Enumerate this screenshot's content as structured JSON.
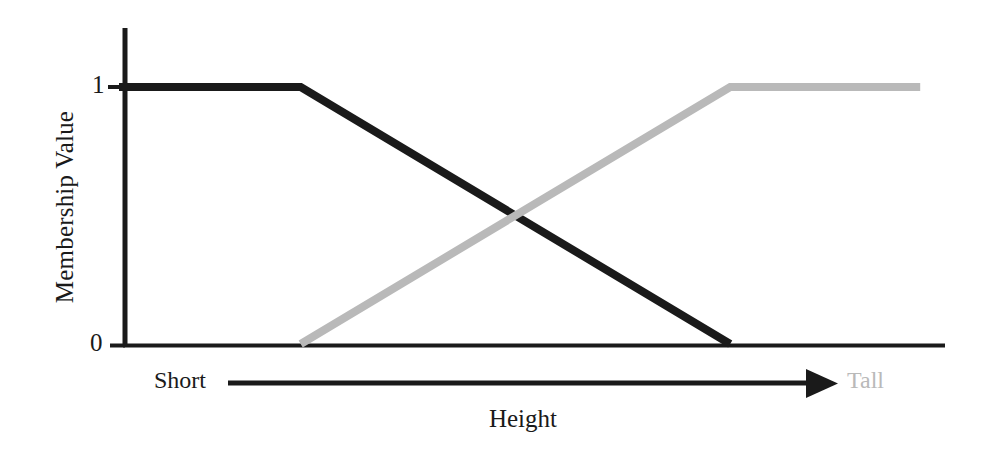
{
  "chart_data": {
    "type": "line",
    "title": "",
    "xlabel": "Height",
    "ylabel": "Membership Value",
    "xlim": [
      0,
      1
    ],
    "ylim": [
      0,
      1
    ],
    "grid": false,
    "legend_position": "none",
    "y_ticks": [
      "0",
      "1"
    ],
    "y_tick_values": [
      0,
      1
    ],
    "x_ticks": [],
    "series": [
      {
        "name": "Short",
        "color": "#1a1a1a",
        "shape": "trapezoid-descending",
        "points": [
          {
            "x": 0.0,
            "y": 1.0
          },
          {
            "x": 0.22,
            "y": 1.0
          },
          {
            "x": 0.74,
            "y": 0.0
          }
        ]
      },
      {
        "name": "Tall",
        "color": "#b9b9b9",
        "shape": "trapezoid-ascending",
        "points": [
          {
            "x": 0.22,
            "y": 0.0
          },
          {
            "x": 0.74,
            "y": 1.0
          },
          {
            "x": 0.97,
            "y": 1.0
          }
        ]
      }
    ],
    "annotations": [
      {
        "name": "axis-direction-arrow",
        "text": "",
        "from_label": "Short",
        "to_label": "Tall"
      }
    ],
    "crossing_point": {
      "x": 0.48,
      "y": 0.5
    }
  },
  "axes": {
    "y_title": "Membership Value",
    "x_title": "Height",
    "tick_one": "1",
    "tick_zero": "0"
  },
  "annotation": {
    "left_label": "Short",
    "right_label": "Tall"
  },
  "colors": {
    "axis": "#1a1a1a",
    "short_line": "#1a1a1a",
    "tall_line": "#b9b9b9",
    "background": "#ffffff"
  }
}
